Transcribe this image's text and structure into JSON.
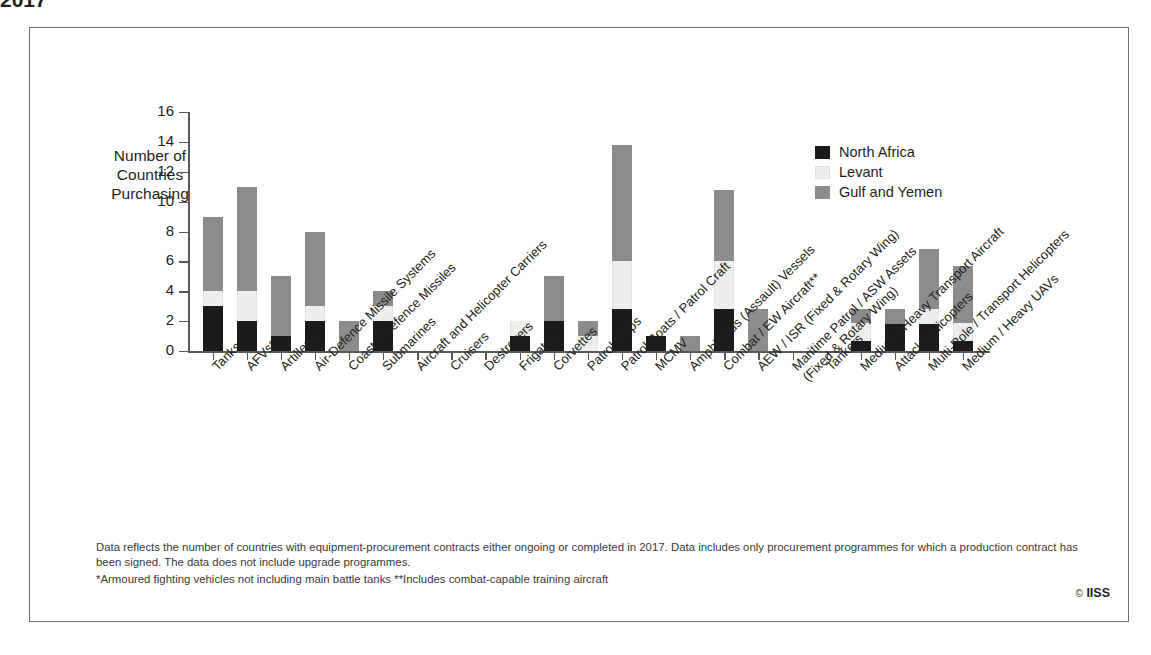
{
  "supertitle": "2017",
  "copyright": "IISS",
  "copyright_mark": "©",
  "legend": {
    "items": [
      {
        "label": "North Africa",
        "color": "#1b1b1b"
      },
      {
        "label": "Levant",
        "color": "#eeeeee"
      },
      {
        "label": "Gulf and Yemen",
        "color": "#8c8c8c"
      }
    ]
  },
  "footnotes": {
    "line1": "Data reflects the number of countries with equipment-procurement contracts either ongoing or completed in 2017. Data includes only procurement programmes for which a production contract",
    "line2": "has been signed. The data does not include upgrade programmes.",
    "line3": "*Armoured fighting vehicles not including main battle tanks  **Includes combat-capable training aircraft"
  },
  "chart_data": {
    "type": "bar",
    "stacked": true,
    "title": "2017",
    "xlabel": "",
    "ylabel": "Number of Countries\nPurchasing",
    "ylim": [
      0,
      16
    ],
    "yticks": [
      0,
      2,
      4,
      6,
      8,
      10,
      12,
      14,
      16
    ],
    "grid": false,
    "legend_position": "right-inside",
    "categories": [
      "Tanks",
      "AFVs*",
      "Artillery",
      "Air-Defence Missile Systems",
      "Coastal Defence Missiles",
      "Submarines",
      "Aircraft and Helicopter Carriers",
      "Cruisers",
      "Destroyers",
      "Frigates",
      "Corvettes",
      "Patrol Ships",
      "Patrol Boats / Patrol Craft",
      "MCMV",
      "Amphibious (Assault) Vessels",
      "Combat / EW Aircraft**",
      "AEW / ISR (Fixed & Rotary Wing)",
      "Maritime Patrol / ASW Assets\n(Fixed & Rotary Wing)",
      "Tankers",
      "Medium / Heavy Transport Aircraft",
      "Attack Helicopters",
      "Multi-Role / Transport Helicopters",
      "Medium / Heavy UAVs"
    ],
    "series": [
      {
        "name": "North Africa",
        "color": "#1b1b1b",
        "values": [
          3,
          2,
          1,
          2,
          0,
          2,
          0,
          0,
          0,
          1,
          2,
          0,
          2.8,
          1,
          0,
          2.8,
          0,
          0,
          0,
          0.7,
          1.8,
          1.8,
          0.7
        ]
      },
      {
        "name": "Levant",
        "color": "#eeeeee",
        "values": [
          1,
          2,
          0,
          1,
          0,
          1,
          0,
          0,
          0,
          1,
          0,
          1,
          3.2,
          0,
          0,
          3.2,
          0,
          0,
          0,
          1.2,
          0,
          1.0,
          1.2
        ]
      },
      {
        "name": "Gulf and Yemen",
        "color": "#8c8c8c",
        "values": [
          5,
          7,
          4,
          5,
          2,
          1,
          0,
          0,
          0,
          0,
          3,
          1,
          7.8,
          0,
          1,
          4.8,
          2.8,
          0,
          0,
          0.9,
          1.0,
          4.0,
          3.8
        ]
      }
    ],
    "totals": [
      9,
      11,
      5,
      8,
      2,
      4,
      0,
      0,
      0,
      2,
      5,
      2,
      13.8,
      1,
      1,
      10.8,
      2.8,
      0,
      0,
      2.8,
      2.8,
      6.8,
      5.7
    ]
  }
}
